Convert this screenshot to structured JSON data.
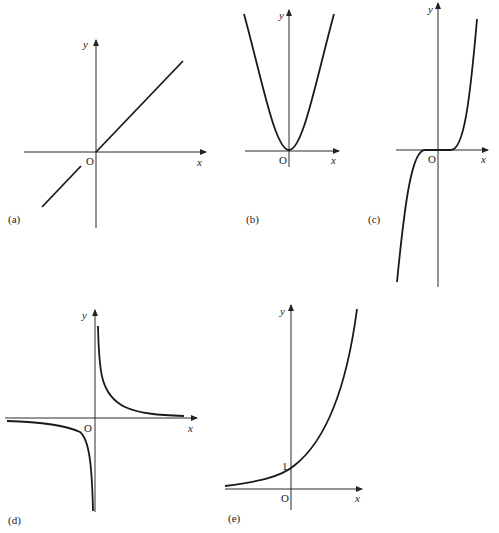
{
  "figures": [
    {
      "id": "a",
      "label": "(a)",
      "function": "y = x",
      "x_axis": "x",
      "y_axis": "y",
      "origin": "O"
    },
    {
      "id": "b",
      "label": "(b)",
      "function": "y = x^2",
      "x_axis": "x",
      "y_axis": "y",
      "origin": "O"
    },
    {
      "id": "c",
      "label": "(c)",
      "function": "y = x^3",
      "x_axis": "x",
      "y_axis": "y",
      "origin": "O"
    },
    {
      "id": "d",
      "label": "(d)",
      "function": "y = 1/x",
      "x_axis": "x",
      "y_axis": "y",
      "origin": "O"
    },
    {
      "id": "e",
      "label": "(e)",
      "function": "y = a^x",
      "x_axis": "x",
      "y_axis": "y",
      "origin": "O",
      "intercept": "1"
    }
  ],
  "colors": {
    "stroke": "#1a1a1a",
    "background": "#ffffff"
  }
}
